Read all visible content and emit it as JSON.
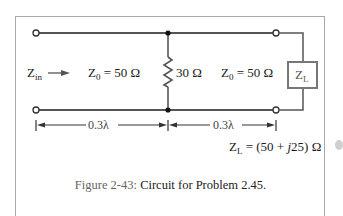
{
  "figure": {
    "caption_label": "Figure 2-43:",
    "caption_text": " Circuit for Problem 2.45."
  },
  "circuit": {
    "input_label": {
      "main": "Z",
      "sub": "in"
    },
    "line1": {
      "z_main": "Z",
      "z_sub": "0",
      "value": " = 50 Ω",
      "length": "0.3λ"
    },
    "shunt_resistor": {
      "value": "30 Ω"
    },
    "line2": {
      "z_main": "Z",
      "z_sub": "0",
      "value": " = 50 Ω",
      "length": "0.3λ"
    },
    "load_box": {
      "main": "Z",
      "sub": "L"
    },
    "load_value": {
      "main": "Z",
      "sub": "L",
      "value": " = (50 + ",
      "j": "j",
      "rest": "25) Ω"
    }
  },
  "colors": {
    "wire": "#555555",
    "frame": "#a8a8a8",
    "text": "#1a1a1a",
    "caption_label": "#666666"
  }
}
